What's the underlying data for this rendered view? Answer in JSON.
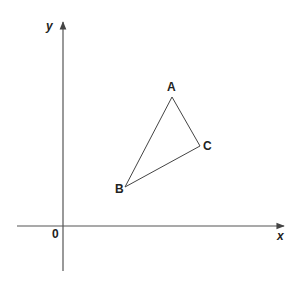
{
  "diagram": {
    "axes": {
      "x_label": "x",
      "y_label": "y",
      "origin_label": "0"
    },
    "triangle": {
      "vertices": [
        {
          "name": "A",
          "x": 172,
          "y": 97
        },
        {
          "name": "B",
          "x": 125,
          "y": 187
        },
        {
          "name": "C",
          "x": 200,
          "y": 146
        }
      ]
    },
    "colors": {
      "axis": "#555555",
      "line": "#444444",
      "text": "#222222"
    }
  }
}
